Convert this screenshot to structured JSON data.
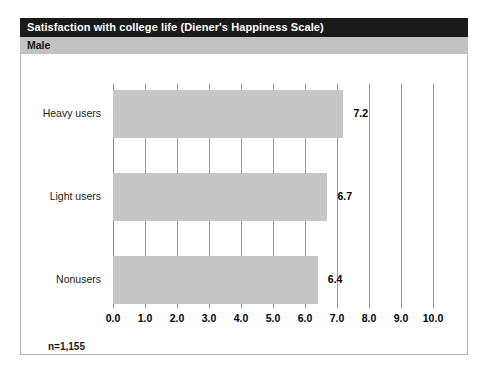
{
  "figure": {
    "title": "Satisfaction with college life (Diener's Happiness Scale)",
    "group": "Male",
    "footnote": "n=1,155"
  },
  "colors": {
    "title_bar": "#1a1a1a",
    "title_text": "#ffffff",
    "group_band": "#c2c2c2",
    "bar_fill": "#c6c6c6",
    "gridline": "#9a9a9a",
    "frame_border": "#b4b4b4",
    "text": "#000000"
  },
  "chart_data": {
    "type": "bar",
    "orientation": "horizontal",
    "title": "Satisfaction with college life (Diener's Happiness Scale)",
    "subtitle": "Male",
    "categories": [
      "Heavy users",
      "Light users",
      "Nonusers"
    ],
    "values": [
      7.2,
      6.7,
      6.4
    ],
    "data_labels": [
      "7.2",
      "6.7",
      "6.4"
    ],
    "xlabel": "",
    "ylabel": "",
    "xlim": [
      0.0,
      10.0
    ],
    "xticks": [
      0.0,
      1.0,
      2.0,
      3.0,
      4.0,
      5.0,
      6.0,
      7.0,
      8.0,
      9.0,
      10.0
    ],
    "xtick_labels": [
      "0.0",
      "1.0",
      "2.0",
      "3.0",
      "4.0",
      "5.0",
      "6.0",
      "7.0",
      "8.0",
      "9.0",
      "10.0"
    ],
    "grid": true,
    "grid_axis": "x",
    "legend": false,
    "annotation": "n=1,155",
    "sample_size": 1155
  }
}
